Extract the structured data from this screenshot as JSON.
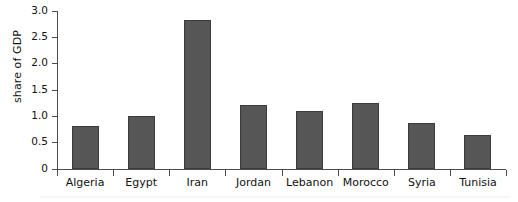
{
  "chart_data": {
    "type": "bar",
    "title": "",
    "xlabel": "",
    "ylabel": "share of GDP",
    "categories": [
      "Algeria",
      "Egypt",
      "Iran",
      "Jordan",
      "Lebanon",
      "Morocco",
      "Syria",
      "Tunisia"
    ],
    "values": [
      0.81,
      1.01,
      2.83,
      1.21,
      1.1,
      1.25,
      0.88,
      0.64
    ],
    "ylim": [
      0,
      3.0
    ],
    "ytick_labels": [
      "0",
      "0.5",
      "1.0",
      "1.5",
      "2.0",
      "2.5",
      "3.0"
    ],
    "ytick_values": [
      0,
      0.5,
      1.0,
      1.5,
      2.0,
      2.5,
      3.0
    ],
    "grid": false,
    "legend": false,
    "bar_color": "#565656",
    "axis_color": "#4d4d4d",
    "background_color": "#ffffff"
  }
}
